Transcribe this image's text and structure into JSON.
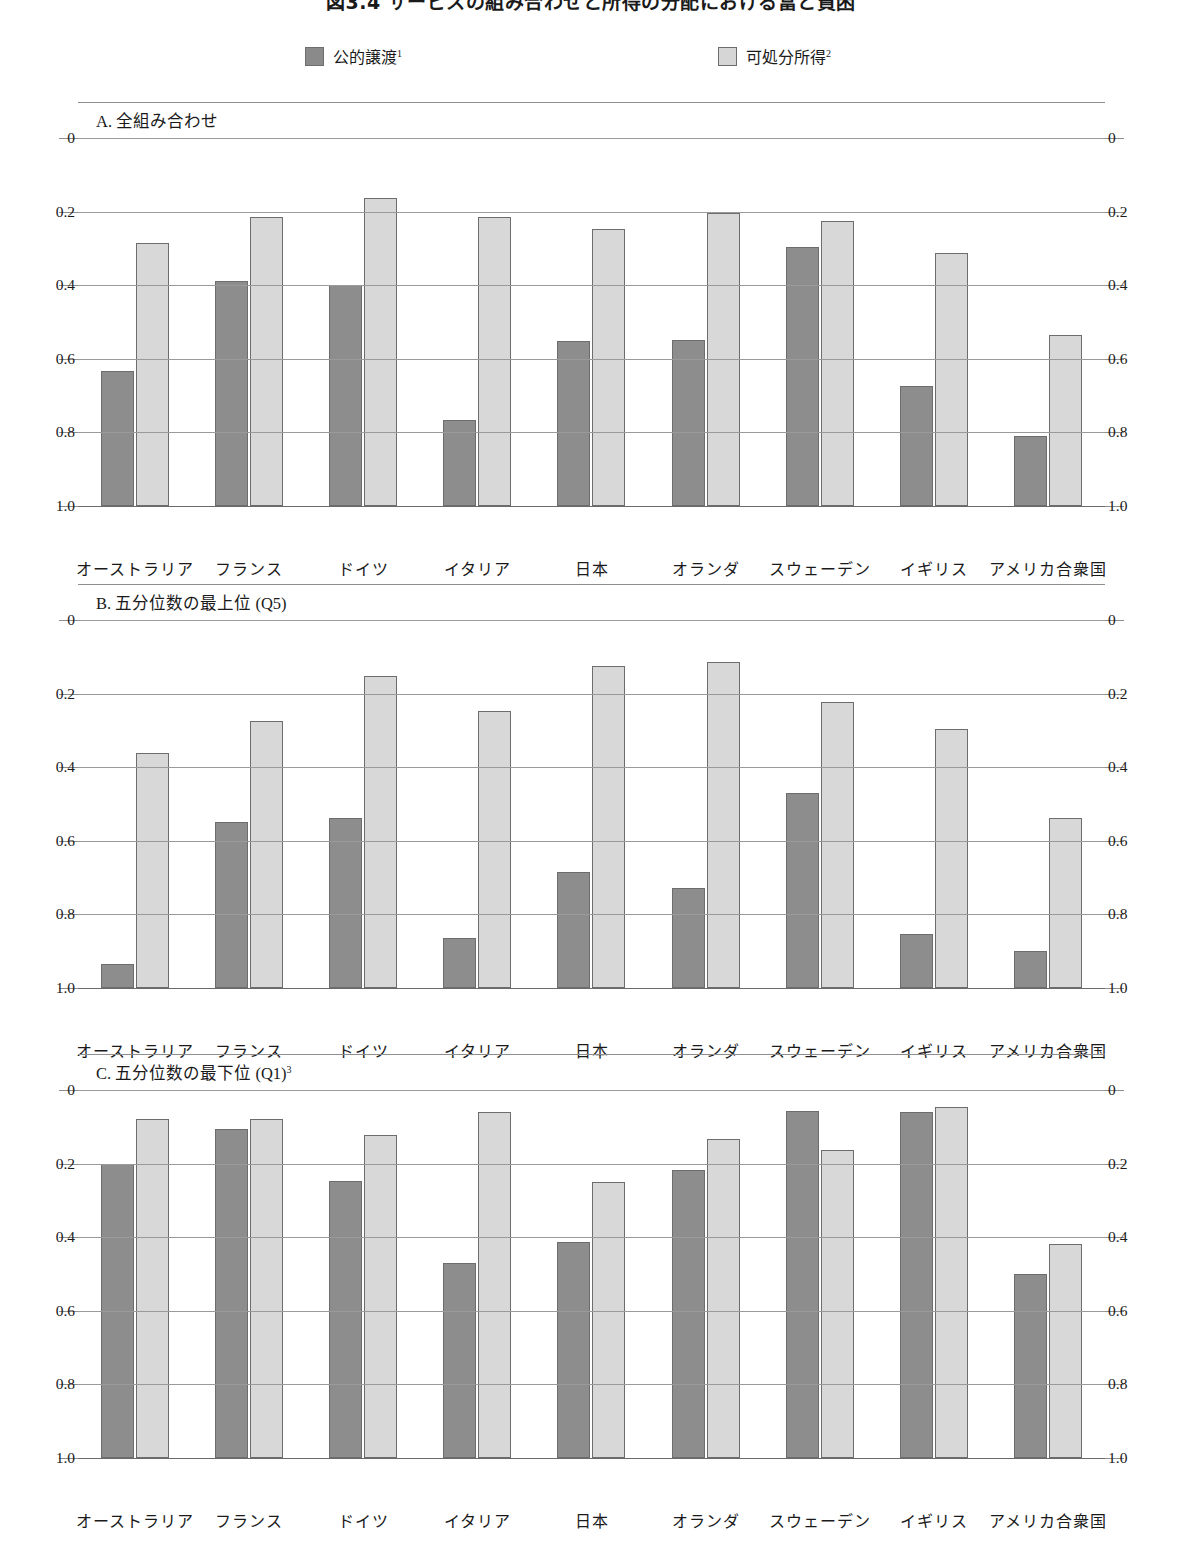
{
  "figure": {
    "title": "図3.4  サービスの組み合わせと所得の分配における富と貧困"
  },
  "legend": {
    "items": [
      {
        "label": "公的譲渡",
        "note": "1",
        "color": "#8d8d8d",
        "name": "public-transfers"
      },
      {
        "label": "可処分所得",
        "note": "2",
        "color": "#d8d8d8",
        "name": "disposable-income"
      }
    ]
  },
  "axis": {
    "ticks": [
      "1.0",
      "0.8",
      "0.6",
      "0.4",
      "0.2",
      "0"
    ],
    "tick_values": [
      1.0,
      0.8,
      0.6,
      0.4,
      0.2,
      0
    ],
    "ymin": 0,
    "ymax": 1.0
  },
  "panels": [
    {
      "id": "A",
      "title": "A. 全組み合わせ",
      "note": ""
    },
    {
      "id": "B",
      "title": "B. 五分位数の最上位 (Q5)",
      "note": ""
    },
    {
      "id": "C",
      "title": "C. 五分位数の最下位 (Q1)",
      "note": "3"
    }
  ],
  "chart_data": [
    {
      "type": "bar",
      "title": "A. 全組み合わせ",
      "panel": "A",
      "xlabel": "",
      "ylabel": "",
      "ylim": [
        0,
        1.0
      ],
      "yticks": [
        0,
        0.2,
        0.4,
        0.6,
        0.8,
        1.0
      ],
      "grid": true,
      "legend_position": "top",
      "categories": [
        "オーストラリア",
        "フランス",
        "ドイツ",
        "イタリア",
        "日本",
        "オランダ",
        "スウェーデン",
        "イギリス",
        "アメリカ合衆国"
      ],
      "series": [
        {
          "name": "公的譲渡",
          "color": "#8d8d8d",
          "values": [
            0.368,
            0.612,
            0.601,
            0.235,
            0.448,
            0.45,
            0.705,
            0.325,
            0.19
          ]
        },
        {
          "name": "可処分所得",
          "color": "#d8d8d8",
          "values": [
            0.714,
            0.785,
            0.838,
            0.785,
            0.752,
            0.797,
            0.774,
            0.688,
            0.464
          ]
        }
      ]
    },
    {
      "type": "bar",
      "title": "B. 五分位数の最上位 (Q5)",
      "panel": "B",
      "xlabel": "",
      "ylabel": "",
      "ylim": [
        0,
        1.0
      ],
      "yticks": [
        0,
        0.2,
        0.4,
        0.6,
        0.8,
        1.0
      ],
      "grid": true,
      "legend_position": "top",
      "categories": [
        "オーストラリア",
        "フランス",
        "ドイツ",
        "イタリア",
        "日本",
        "オランダ",
        "スウェーデン",
        "イギリス",
        "アメリカ合衆国"
      ],
      "series": [
        {
          "name": "公的譲渡",
          "color": "#8d8d8d",
          "values": [
            0.066,
            0.451,
            0.461,
            0.136,
            0.315,
            0.271,
            0.531,
            0.148,
            0.1
          ]
        },
        {
          "name": "可処分所得",
          "color": "#d8d8d8",
          "values": [
            0.638,
            0.726,
            0.848,
            0.752,
            0.875,
            0.886,
            0.777,
            0.705,
            0.462
          ]
        }
      ]
    },
    {
      "type": "bar",
      "title": "C. 五分位数の最下位 (Q1)",
      "panel": "C",
      "xlabel": "",
      "ylabel": "",
      "ylim": [
        0,
        1.0
      ],
      "yticks": [
        0,
        0.2,
        0.4,
        0.6,
        0.8,
        1.0
      ],
      "grid": true,
      "legend_position": "top",
      "categories": [
        "オーストラリア",
        "フランス",
        "ドイツ",
        "イタリア",
        "日本",
        "オランダ",
        "スウェーデン",
        "イギリス",
        "アメリカ合衆国"
      ],
      "series": [
        {
          "name": "公的譲渡",
          "color": "#8d8d8d",
          "values": [
            0.798,
            0.893,
            0.752,
            0.53,
            0.587,
            0.782,
            0.944,
            0.941,
            0.501
          ]
        },
        {
          "name": "可処分所得",
          "color": "#d8d8d8",
          "values": [
            0.92,
            0.922,
            0.878,
            0.941,
            0.75,
            0.867,
            0.838,
            0.955,
            0.581
          ]
        }
      ]
    }
  ]
}
